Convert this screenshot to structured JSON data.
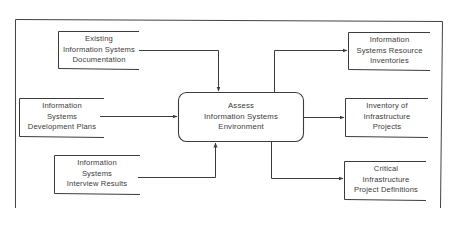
{
  "diagram": {
    "type": "data-flow",
    "process": {
      "id": "assess",
      "lines": [
        "Assess",
        "Information Systems",
        "Environment"
      ]
    },
    "inputs": [
      {
        "id": "existing-docs",
        "lines": [
          "Existing",
          "Information Systems",
          "Documentation"
        ]
      },
      {
        "id": "dev-plans",
        "lines": [
          "Information",
          "Systems",
          "Development Plans"
        ]
      },
      {
        "id": "interview-results",
        "lines": [
          "Information",
          "Systems",
          "Interview Results"
        ]
      }
    ],
    "outputs": [
      {
        "id": "resource-inventories",
        "lines": [
          "Information",
          "Systems Resource",
          "Inventories"
        ]
      },
      {
        "id": "infra-projects",
        "lines": [
          "Inventory of",
          "Infrastructure",
          "Projects"
        ]
      },
      {
        "id": "critical-definitions",
        "lines": [
          "Critical",
          "Infrastructure",
          "Project Definitions"
        ]
      }
    ],
    "edges": [
      {
        "from": "existing-docs",
        "to": "assess"
      },
      {
        "from": "dev-plans",
        "to": "assess"
      },
      {
        "from": "interview-results",
        "to": "assess"
      },
      {
        "from": "assess",
        "to": "resource-inventories"
      },
      {
        "from": "assess",
        "to": "infra-projects"
      },
      {
        "from": "assess",
        "to": "critical-definitions"
      }
    ],
    "colors": {
      "line": "#3c3c3c",
      "text": "#3a3a3a",
      "background": "#ffffff"
    }
  }
}
